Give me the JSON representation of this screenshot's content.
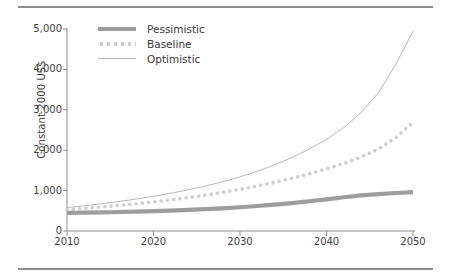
{
  "figure": {
    "top_rule": "",
    "bottom_rule": ""
  },
  "chart_data": {
    "type": "line",
    "title": "",
    "xlabel": "",
    "ylabel": "Constant 2000 US$",
    "xlim": [
      2010,
      2050
    ],
    "ylim": [
      0,
      5000
    ],
    "grid": false,
    "legend_position": "top-left",
    "x_ticks": [
      "2010",
      "2020",
      "2030",
      "2040",
      "2050"
    ],
    "y_ticks": [
      "0",
      "1,000",
      "2,000",
      "3,000",
      "4,000",
      "5,000"
    ],
    "x": [
      2010,
      2012,
      2014,
      2016,
      2018,
      2020,
      2022,
      2024,
      2026,
      2028,
      2030,
      2032,
      2034,
      2036,
      2038,
      2040,
      2042,
      2044,
      2046,
      2048,
      2050
    ],
    "series": [
      {
        "name": "Pessimistic",
        "style": "thick-solid",
        "color": "#9d9d9d",
        "values": [
          450,
          455,
          462,
          470,
          480,
          492,
          506,
          522,
          540,
          562,
          588,
          618,
          652,
          692,
          736,
          784,
          836,
          880,
          912,
          940,
          960
        ]
      },
      {
        "name": "Baseline",
        "style": "dotted",
        "color": "#cfcfcf",
        "values": [
          530,
          560,
          594,
          632,
          674,
          720,
          772,
          828,
          890,
          958,
          1032,
          1114,
          1204,
          1304,
          1414,
          1536,
          1670,
          1830,
          2030,
          2310,
          2690
        ]
      },
      {
        "name": "Optimistic",
        "style": "thin-solid",
        "color": "#b8b8b8",
        "values": [
          580,
          624,
          674,
          730,
          792,
          860,
          936,
          1020,
          1114,
          1220,
          1340,
          1478,
          1636,
          1818,
          2026,
          2266,
          2560,
          2930,
          3420,
          4120,
          4950
        ]
      }
    ]
  }
}
